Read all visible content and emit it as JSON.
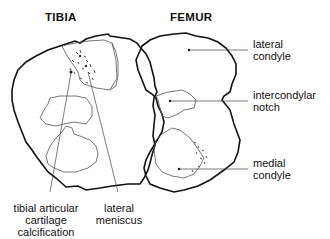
{
  "titles": {
    "tibia": "TIBIA",
    "femur": "FEMUR"
  },
  "labels": {
    "lateral_condyle": [
      "lateral",
      "condyle"
    ],
    "intercondylar_notch": [
      "intercondylar",
      "notch"
    ],
    "medial_condyle": [
      "medial",
      "condyle"
    ],
    "tibial_cartilage": [
      "tibial articular",
      "cartilage",
      "calcification"
    ],
    "lateral_meniscus": [
      "lateral",
      "meniscus"
    ]
  },
  "colors": {
    "outline": "#111111",
    "inner": "#555555"
  }
}
